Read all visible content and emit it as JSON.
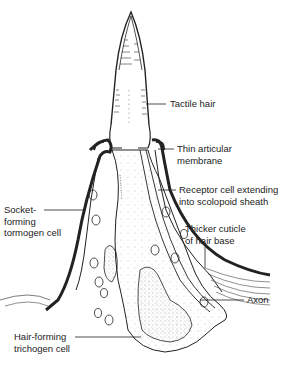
{
  "diagram": {
    "labels": {
      "tactile_hair": [
        "Tactile hair"
      ],
      "thin_articular_membrane": [
        "Thin articular",
        "membrane"
      ],
      "receptor_cell": [
        "Receptor cell extending",
        "into scolopoid sheath"
      ],
      "socket_forming": [
        "Socket-",
        "forming",
        "tormogen cell"
      ],
      "thicker_cuticle": [
        "Thicker cuticle",
        "of hair base"
      ],
      "axon": [
        "Axon"
      ],
      "hair_forming": [
        "Hair-forming",
        "trichogen cell"
      ]
    },
    "colors": {
      "ink": "#222222",
      "background": "#ffffff",
      "stipple": "#555555"
    }
  }
}
